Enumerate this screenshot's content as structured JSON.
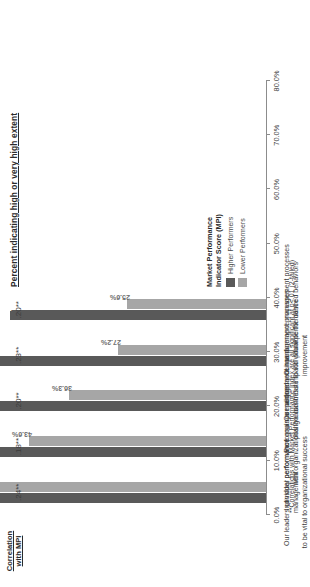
{
  "chart_data": {
    "type": "bar",
    "title": "Percent indicating high or very high extent",
    "xlabel": "",
    "ylabel": "",
    "xlim": [
      0,
      80
    ],
    "grid": false,
    "orientation": "horizontal",
    "legend_position": "bottom-right",
    "axis_ticks": [
      "0.0%",
      "10.0%",
      "20.0%",
      "30.0%",
      "40.0%",
      "50.0%",
      "60.0%",
      "70.0%",
      "80.0%"
    ],
    "axis_tick_values": [
      0,
      10,
      20,
      30,
      40,
      50,
      60,
      70,
      80
    ],
    "categories": [
      "Our leaders consider performance management\nto be vital to organizational success",
      "Individual performance goals are aligned\nwith organizational goals",
      "Performance management has a\npositive business impact",
      "Our performance management processes\ncontribute to individual performance improvement",
      "Our performance management processes\npromote the desired behaviors"
    ],
    "series": [
      {
        "name": "Higher Performers",
        "color": "#595959",
        "values": [
          74.7,
          60.5,
          55.3,
          52.2,
          47.2
        ],
        "labels": [
          "74.7%",
          "60.5%",
          "55.3%",
          "52.2%",
          "47.2%"
        ]
      },
      {
        "name": "Lower Performers",
        "color": "#a6a6a6",
        "values": [
          52.2,
          43.6,
          36.3,
          27.2,
          25.6
        ],
        "labels": [
          "52.2%",
          "43.6%",
          "36.3%",
          "27.2%",
          "25.6%"
        ]
      }
    ],
    "annotations": {
      "correlation_header": "Correlation\nwith MPI",
      "correlation_values": [
        ".24**",
        ".18**",
        ".20**",
        ".23**",
        ".20**"
      ]
    },
    "legend_title": "Market Performance\nIndicator Score  (MPI)",
    "footnote": "**Correlations with Market Performance Index are all significant at  p<.01 (2-tailed)"
  }
}
